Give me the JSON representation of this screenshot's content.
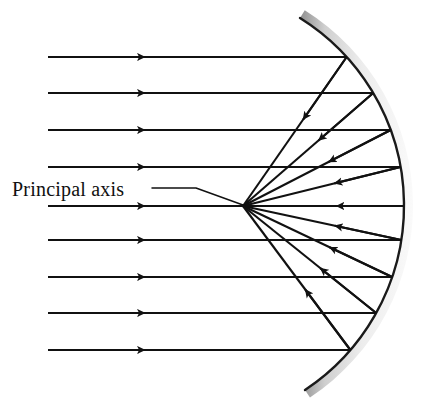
{
  "figure": {
    "background_color": "#ffffff",
    "width": 426,
    "height": 406
  },
  "labels": {
    "principal_axis": "Principal axis"
  },
  "colors": {
    "ray_stroke": "#111111",
    "mirror_edge": "#1a1a1a",
    "mirror_fill_light": "#f2f2f2",
    "mirror_fill_mid": "#c9c9c9",
    "mirror_fill_dark": "#9a9a9a",
    "label_text": "#101010",
    "leader_line": "#111111"
  },
  "geometry": {
    "focal_point": {
      "x": 243,
      "y": 206
    },
    "mirror": {
      "top_end": {
        "x": 300,
        "y": 18
      },
      "bottom_end": {
        "x": 305,
        "y": 390
      },
      "vertex": {
        "x": 404,
        "y": 206
      },
      "thickness": 9
    },
    "ray_start_x": 48,
    "leader": {
      "text_anchor": {
        "x": 12,
        "y": 196
      },
      "h_start": {
        "x": 152,
        "y": 188
      },
      "h_end": {
        "x": 196,
        "y": 188
      },
      "tip": {
        "x": 243,
        "y": 205
      }
    }
  },
  "rays": [
    {
      "id": "ray-1",
      "y": 57,
      "hit": {
        "x": 319,
        "y": 57
      },
      "incoming_arrow_x": 145
    },
    {
      "id": "ray-2",
      "y": 93,
      "hit": {
        "x": 345,
        "y": 93
      },
      "incoming_arrow_x": 145
    },
    {
      "id": "ray-3",
      "y": 130,
      "hit": {
        "x": 369,
        "y": 130
      },
      "incoming_arrow_x": 145
    },
    {
      "id": "ray-4",
      "y": 167,
      "hit": {
        "x": 389,
        "y": 167
      },
      "incoming_arrow_x": 145
    },
    {
      "id": "ray-5",
      "y": 206,
      "hit": {
        "x": 402,
        "y": 206
      },
      "incoming_arrow_x": 145
    },
    {
      "id": "ray-6",
      "y": 240,
      "hit": {
        "x": 392,
        "y": 240
      },
      "incoming_arrow_x": 145
    },
    {
      "id": "ray-7",
      "y": 277,
      "hit": {
        "x": 374,
        "y": 277
      },
      "incoming_arrow_x": 145
    },
    {
      "id": "ray-8",
      "y": 313,
      "hit": {
        "x": 350,
        "y": 313
      },
      "incoming_arrow_x": 145
    },
    {
      "id": "ray-9",
      "y": 350,
      "hit": {
        "x": 322,
        "y": 350
      },
      "incoming_arrow_x": 145
    }
  ],
  "annotations": {
    "ray_count": 9,
    "incoming_direction": "left-to-right",
    "reflected_direction": "toward-focal-point",
    "mirror_type": "concave"
  }
}
